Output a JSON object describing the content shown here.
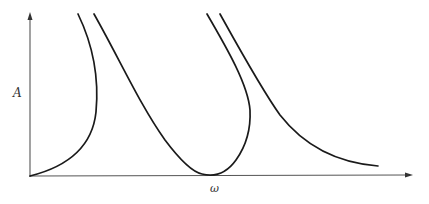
{
  "diagram": {
    "type": "frequency-response-curves",
    "axes": {
      "y_label": "A",
      "x_label": "ω"
    },
    "curves": [
      {
        "name": "left-bent-branch",
        "description": "rises from origin, bends back toward upper left"
      },
      {
        "name": "middle-resonance-curve",
        "description": "descends to touch x-axis, then bends back upward"
      },
      {
        "name": "right-decaying-branch",
        "description": "descends from top and decays toward x-axis"
      }
    ],
    "colors": {
      "axis": "#555555",
      "curve": "#1a1a1a",
      "background": "#ffffff"
    }
  }
}
